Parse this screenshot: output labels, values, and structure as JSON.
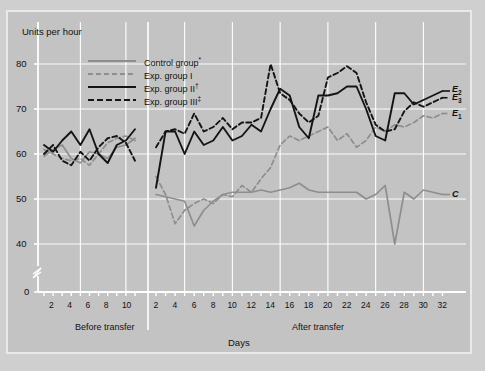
{
  "figure": {
    "panel_bg": "#c3c3c3",
    "page_bg": "#cfcfcf",
    "frame_color": "#e9e9e9"
  },
  "axes": {
    "y_axis_title": "Units per hour",
    "x_axis_title": "Days",
    "y_ticks": [
      "0",
      "40",
      "50",
      "60",
      "70",
      "80"
    ],
    "y_min": 36,
    "y_max": 84,
    "y_break": true,
    "x_ticks_before": [
      "2",
      "4",
      "6",
      "8",
      "10"
    ],
    "x_ticks_after": [
      "2",
      "4",
      "6",
      "8",
      "10",
      "12",
      "14",
      "16",
      "18",
      "20",
      "22",
      "24",
      "26",
      "28",
      "30",
      "32"
    ],
    "phase_before_label": "Before transfer",
    "phase_after_label": "After transfer",
    "gridlines": true,
    "grid_color": "#ffffff"
  },
  "legend": {
    "position": "top-left-inside",
    "items": [
      {
        "label": "Control group",
        "marker": "*",
        "style": "solid-gray",
        "color": "#8e8e8e"
      },
      {
        "label": "Exp. group I",
        "marker": "",
        "style": "dashed-gray",
        "color": "#8e8e8e"
      },
      {
        "label": "Exp. group II",
        "marker": "†",
        "style": "solid-black",
        "color": "#141414"
      },
      {
        "label": "Exp. group III",
        "marker": "‡",
        "style": "dashed-black",
        "color": "#141414"
      }
    ]
  },
  "end_labels": [
    {
      "text": "E",
      "sub": "2",
      "series": "Exp. group II"
    },
    {
      "text": "E",
      "sub": "3",
      "series": "Exp. group III"
    },
    {
      "text": "E",
      "sub": "1",
      "series": "Exp. group I"
    },
    {
      "text": "C",
      "sub": "",
      "series": "Control group"
    }
  ],
  "chart_data": {
    "type": "line",
    "title": "",
    "xlabel": "Days",
    "ylabel": "Units per hour",
    "ylim": [
      36,
      84
    ],
    "grid": true,
    "legend_position": "top-left-inside",
    "phases": [
      "Before transfer",
      "After transfer"
    ],
    "x_before": [
      1,
      2,
      3,
      4,
      5,
      6,
      7,
      8,
      9,
      10,
      11
    ],
    "x_after": [
      2,
      3,
      4,
      5,
      6,
      7,
      8,
      9,
      10,
      11,
      12,
      13,
      14,
      15,
      16,
      17,
      18,
      19,
      20,
      21,
      22,
      23,
      24,
      25,
      26,
      27,
      28,
      29,
      30,
      31,
      32
    ],
    "series": [
      {
        "name": "Control group",
        "symbol": "C",
        "color": "#8e8e8e",
        "style": "solid",
        "before": [
          59.5,
          61.0,
          62.0,
          59.0,
          58.0,
          60.5,
          60.0,
          59.0,
          61.5,
          62.0,
          63.5
        ],
        "after": [
          51.0,
          50.5,
          50.0,
          49.5,
          44.0,
          47.5,
          49.5,
          51.0,
          51.5,
          51.5,
          51.5,
          52.0,
          51.5,
          52.0,
          52.5,
          53.5,
          52.0,
          51.5,
          51.5,
          51.5,
          51.5,
          51.5,
          50.0,
          51.0,
          53.0,
          40.0,
          51.5,
          50.0,
          52.0,
          51.5,
          51.0
        ]
      },
      {
        "name": "Exp. group I",
        "symbol": "E1",
        "color": "#8e8e8e",
        "style": "dashed",
        "before": [
          61.0,
          60.0,
          59.0,
          58.5,
          59.0,
          57.5,
          60.0,
          62.5,
          63.5,
          64.0,
          63.0
        ],
        "after": [
          55.0,
          51.0,
          44.5,
          47.5,
          49.0,
          50.0,
          49.0,
          51.0,
          50.5,
          53.0,
          51.5,
          54.5,
          57.0,
          62.0,
          64.0,
          63.0,
          64.0,
          65.0,
          66.0,
          63.0,
          64.5,
          61.5,
          63.0,
          66.0,
          65.0,
          66.5,
          66.0,
          67.0,
          68.5,
          68.0,
          69.0
        ]
      },
      {
        "name": "Exp. group II",
        "symbol": "E2",
        "color": "#141414",
        "style": "solid",
        "before": [
          62.0,
          60.5,
          63.0,
          65.0,
          62.0,
          65.5,
          60.0,
          58.0,
          62.0,
          63.0,
          65.5
        ],
        "after": [
          52.5,
          65.0,
          65.0,
          60.0,
          65.0,
          62.0,
          63.0,
          66.0,
          63.0,
          64.0,
          66.5,
          65.0,
          70.0,
          74.5,
          73.0,
          66.0,
          63.5,
          73.0,
          73.0,
          73.5,
          75.0,
          75.0,
          70.0,
          64.0,
          63.0,
          73.5,
          73.5,
          71.0,
          72.0,
          73.0,
          74.0
        ]
      },
      {
        "name": "Exp. group III",
        "symbol": "E3",
        "color": "#141414",
        "style": "dashed",
        "before": [
          60.0,
          62.0,
          58.5,
          57.5,
          60.5,
          58.5,
          61.5,
          63.5,
          64.0,
          62.5,
          58.5
        ],
        "after": [
          61.5,
          65.0,
          65.5,
          64.5,
          69.0,
          65.0,
          66.0,
          68.0,
          65.5,
          67.0,
          67.0,
          68.0,
          80.0,
          73.5,
          72.0,
          69.0,
          67.0,
          68.5,
          77.0,
          78.0,
          79.5,
          78.0,
          71.5,
          66.5,
          65.0,
          65.5,
          69.5,
          71.5,
          70.5,
          71.5,
          72.5
        ]
      }
    ]
  }
}
